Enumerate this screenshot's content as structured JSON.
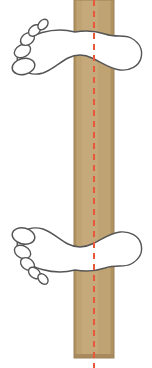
{
  "scene": {
    "title": "Feet stance on balance beam",
    "canvas": {
      "width": 152,
      "height": 368
    },
    "background_color": "#ffffff"
  },
  "beam": {
    "name": "wooden-beam",
    "fill_color": "#c0a372",
    "edge_color": "#b09260",
    "highlight_color": "#cbb184",
    "x_left": 74,
    "x_right": 114,
    "y_top": 0,
    "y_bottom": 358,
    "width": 40,
    "orientation": "vertical"
  },
  "centerline": {
    "name": "beam-centerline",
    "color": "#e8573a",
    "x": 94,
    "y_top": 0,
    "y_bottom": 368,
    "stroke_width": 2,
    "dash_length": 6,
    "gap_length": 5,
    "style": "dashed"
  },
  "feet": [
    {
      "id": "upper-foot",
      "label": "Upper foot",
      "side": "left-foot",
      "outline_color": "#555555",
      "fill_color": "#ffffff",
      "stroke_width": 1.4,
      "toe_count": 5,
      "toe_direction": "left",
      "heel_direction": "right",
      "big_toe_position": "bottom-left",
      "arch_y": 52,
      "heel_center": {
        "x": 122,
        "y": 56
      },
      "ball_center": {
        "x": 46,
        "y": 46
      }
    },
    {
      "id": "lower-foot",
      "label": "Lower foot",
      "side": "right-foot",
      "outline_color": "#555555",
      "fill_color": "#ffffff",
      "stroke_width": 1.4,
      "toe_count": 5,
      "toe_direction": "left",
      "heel_direction": "right",
      "big_toe_position": "top-left",
      "arch_y": 264,
      "heel_center": {
        "x": 122,
        "y": 258
      },
      "ball_center": {
        "x": 46,
        "y": 252
      }
    }
  ],
  "upper_foot_toes": [
    {
      "name": "big-toe",
      "cx": 23.5,
      "cy": 66.5,
      "rx": 11.5,
      "ry": 8.0,
      "rot": -14
    },
    {
      "name": "second-toe",
      "cx": 22.5,
      "cy": 51.0,
      "rx": 8.6,
      "ry": 6.2,
      "rot": -28
    },
    {
      "name": "third-toe",
      "cx": 27.5,
      "cy": 39.0,
      "rx": 7.6,
      "ry": 5.6,
      "rot": -36
    },
    {
      "name": "fourth-toe",
      "cx": 34.5,
      "cy": 30.5,
      "rx": 6.8,
      "ry": 4.8,
      "rot": -42
    },
    {
      "name": "little-toe",
      "cx": 43.0,
      "cy": 24.5,
      "rx": 6.0,
      "ry": 4.2,
      "rot": -48
    }
  ],
  "lower_foot_toes": [
    {
      "name": "big-toe",
      "cx": 23.5,
      "cy": 236.0,
      "rx": 11.5,
      "ry": 8.0,
      "rot": 14
    },
    {
      "name": "second-toe",
      "cx": 22.5,
      "cy": 252.0,
      "rx": 8.6,
      "ry": 6.2,
      "rot": 28
    },
    {
      "name": "third-toe",
      "cx": 27.5,
      "cy": 264.0,
      "rx": 7.6,
      "ry": 5.6,
      "rot": 36
    },
    {
      "name": "fourth-toe",
      "cx": 34.5,
      "cy": 273.0,
      "rx": 6.8,
      "ry": 4.8,
      "rot": 42
    },
    {
      "name": "little-toe",
      "cx": 43.0,
      "cy": 279.0,
      "rx": 6.0,
      "ry": 4.2,
      "rot": 48
    }
  ],
  "paths": {
    "upper_foot_sole": "M 75 32 C 86 30 96 31 105 34 C 116 38 124 34 131 38 C 140 43 143 50 141 58 C 139 66 130 71 120 70 C 110 69 101 62 92 58 C 84 54 76 54 68 58 C 60 62 52 70 43 73 C 33 76 23 73 19 65 C 15 57 18 47 25 41 C 34 33 50 30 60 30 C 66 30 71 31 75 32 Z",
    "lower_foot_sole": "M 75 270 C 86 272 96 271 105 268 C 116 264 124 268 131 264 C 140 259 143 252 141 244 C 139 236 130 231 120 232 C 110 233 101 240 92 244 C 84 248 76 248 68 244 C 60 240 52 232 43 229 C 33 226 23 229 19 237 C 15 245 18 255 25 261 C 34 269 50 272 60 272 C 66 272 71 271 75 270 Z"
  }
}
